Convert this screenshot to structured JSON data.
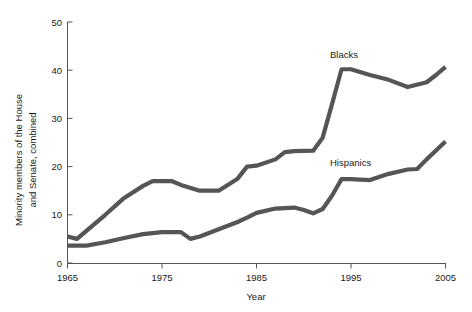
{
  "chart_data": {
    "type": "line",
    "title": "",
    "subtitle": "",
    "xlabel": "Year",
    "ylabel": "Minority members of the House and Senate, combined",
    "ylabel_line1": "Minority members of the House",
    "ylabel_line2": "and Senate, combined",
    "xlim": [
      1965,
      2005
    ],
    "ylim": [
      0,
      50
    ],
    "xticks": [
      1965,
      1975,
      1985,
      1995,
      2005
    ],
    "xtick_labels": [
      "1965",
      "1975",
      "1985",
      "1995",
      "2005"
    ],
    "yticks": [
      0,
      10,
      20,
      30,
      40,
      50
    ],
    "ytick_labels": [
      "0",
      "10",
      "20",
      "30",
      "40",
      "50"
    ],
    "grid": false,
    "legend_position": "inline-annotation",
    "line_color": "#555555",
    "x": [
      1965,
      1967,
      1969,
      1971,
      1973,
      1975,
      1977,
      1979,
      1981,
      1983,
      1985,
      1987,
      1989,
      1991,
      1993,
      1995,
      1997,
      1999,
      2001,
      2003,
      2005
    ],
    "series": [
      {
        "name": "Blacks",
        "label": "Blacks",
        "color": "#555555",
        "label_x": 1993,
        "label_y": 45,
        "values": [
          6,
          6,
          10,
          13,
          16,
          17,
          17,
          16,
          15,
          16,
          18,
          20,
          20,
          21,
          23,
          26,
          40,
          40,
          39,
          37,
          41
        ]
      },
      {
        "name": "Hispanics",
        "label": "Hispanics",
        "color": "#555555",
        "label_x": 1993,
        "label_y": 21,
        "values": [
          4,
          4,
          5,
          5.5,
          6,
          6,
          6,
          5,
          7,
          8,
          9,
          10,
          11,
          11.5,
          11,
          11.5,
          17.5,
          17.5,
          18,
          19.5,
          25
        ]
      }
    ],
    "series_dense": {
      "blacks_x": [
        1965,
        1966,
        1969,
        1971,
        1973,
        1974,
        1976,
        1977,
        1979,
        1981,
        1983,
        1984,
        1985,
        1987,
        1988,
        1989,
        1991,
        1992,
        1993,
        1994,
        1995,
        1997,
        1999,
        2001,
        2003,
        2004,
        2005
      ],
      "blacks_y": [
        5.5,
        5.0,
        10.0,
        13.5,
        16.0,
        17.0,
        17.0,
        16.2,
        15.0,
        15.0,
        17.5,
        20.0,
        20.2,
        21.5,
        23.0,
        23.2,
        23.3,
        26.0,
        33.0,
        40.2,
        40.2,
        39.0,
        38.0,
        36.5,
        37.5,
        39.0,
        40.7
      ],
      "hispanics_x": [
        1965,
        1967,
        1969,
        1971,
        1973,
        1975,
        1977,
        1978,
        1979,
        1981,
        1983,
        1984,
        1985,
        1987,
        1989,
        1990,
        1991,
        1992,
        1993,
        1994,
        1995,
        1997,
        1999,
        2001,
        2002,
        2003,
        2005
      ],
      "hispanics_y": [
        3.6,
        3.6,
        4.3,
        5.2,
        6.0,
        6.4,
        6.4,
        5.0,
        5.5,
        7.0,
        8.5,
        9.4,
        10.4,
        11.3,
        11.5,
        11.0,
        10.3,
        11.2,
        14.0,
        17.4,
        17.4,
        17.2,
        18.5,
        19.4,
        19.5,
        21.5,
        25.2
      ]
    }
  },
  "axes": {
    "x_title": "Year",
    "y_title_line1": "Minority members of the House",
    "y_title_line2": "and Senate, combined"
  },
  "annotations": {
    "blacks": "Blacks",
    "hispanics": "Hispanics"
  }
}
